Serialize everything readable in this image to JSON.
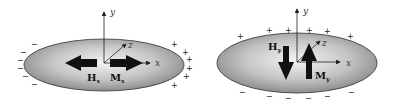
{
  "figure": {
    "left": {
      "axes": {
        "x": "x",
        "y": "y",
        "z": "z"
      },
      "field_label": {
        "main": "H",
        "sub": "x"
      },
      "magnetization_label": {
        "main": "M",
        "sub": "x"
      },
      "charges": {
        "left_side": "−",
        "right_side": "+"
      },
      "field_direction": "-x",
      "magnetization_direction": "+x"
    },
    "right": {
      "axes": {
        "x": "x",
        "y": "y",
        "z": "z"
      },
      "field_label": {
        "main": "H",
        "sub": "y"
      },
      "magnetization_label": {
        "main": "M",
        "sub": "y"
      },
      "charges": {
        "top_side": "+",
        "bottom_side": "−"
      },
      "field_direction": "-y",
      "magnetization_direction": "+y"
    }
  },
  "colors": {
    "ellipse_center": "#f2f2f2",
    "ellipse_edge": "#8a8a8a",
    "arrow": "#111111"
  }
}
